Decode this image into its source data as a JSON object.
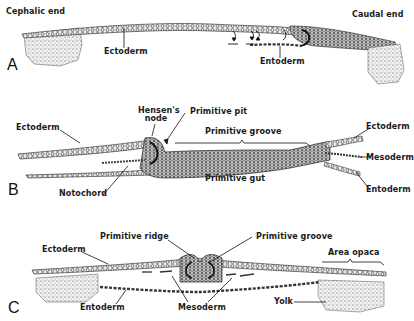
{
  "figure": {
    "panels": [
      {
        "letter": "A",
        "labels": {
          "cephalic_end": "Cephalic end",
          "caudal_end": "Caudal end",
          "ectoderm": "Ectoderm",
          "entoderm": "Entoderm"
        }
      },
      {
        "letter": "B",
        "labels": {
          "ectoderm_left": "Ectoderm",
          "hensens_node_line1": "Hensen's",
          "hensens_node_line2": "node",
          "primitive_pit": "Primitive pit",
          "primitive_groove": "Primitive groove",
          "ectoderm_right": "Ectoderm",
          "mesoderm": "Mesoderm",
          "notochord": "Notochord",
          "primitive_gut": "Primitive gut",
          "entoderm": "Entoderm"
        }
      },
      {
        "letter": "C",
        "labels": {
          "ectoderm": "Ectoderm",
          "primitive_ridge": "Primitive ridge",
          "primitive_groove": "Primitive groove",
          "area_opaca": "Area opaca",
          "entoderm": "Entoderm",
          "mesoderm": "Mesoderm",
          "yolk": "Yolk"
        }
      }
    ],
    "colors": {
      "ink": "#1a1a1a",
      "background": "#ffffff",
      "tissue_fill": "#d9d9d9"
    }
  }
}
